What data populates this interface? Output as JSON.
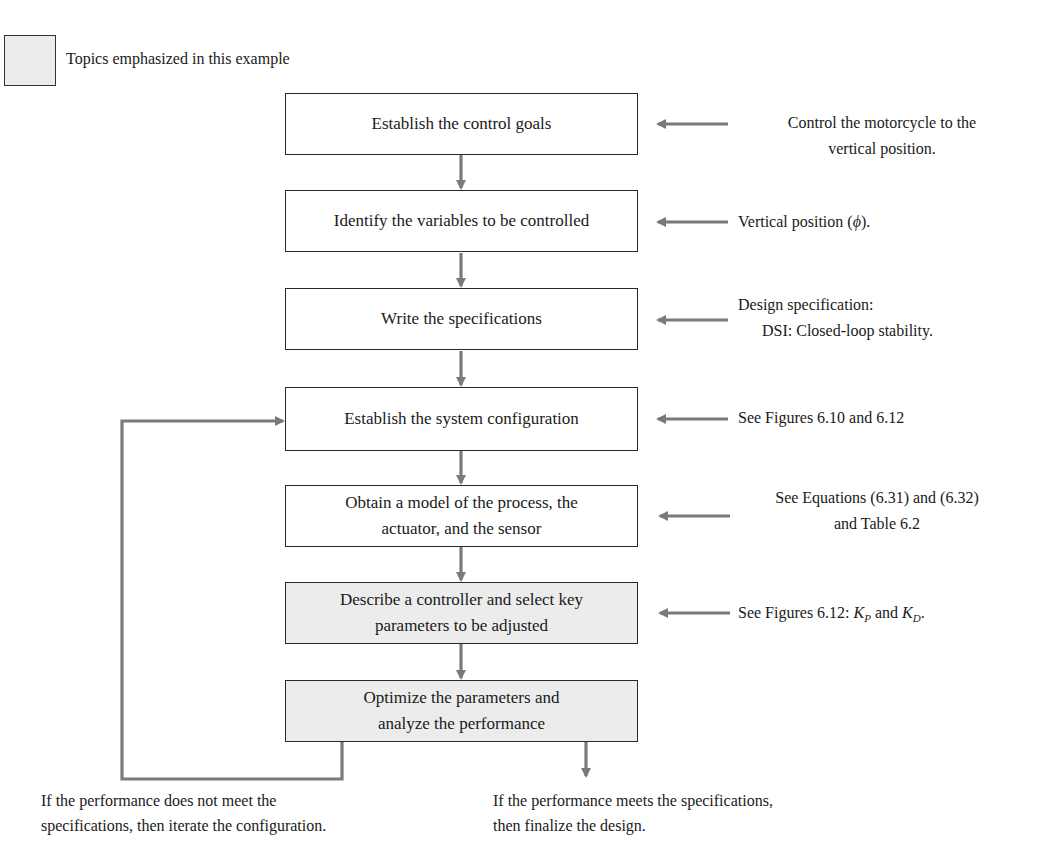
{
  "legend": {
    "label": "Topics emphasized in this example",
    "swatch_color": "#ececec"
  },
  "steps": [
    {
      "label": "Establish the control goals",
      "emphasized": false
    },
    {
      "label": "Identify the variables to be controlled",
      "emphasized": false
    },
    {
      "label": "Write the specifications",
      "emphasized": false
    },
    {
      "label": "Establish the system configuration",
      "emphasized": false
    },
    {
      "label_line1": "Obtain a model of the process, the",
      "label_line2": "actuator, and the sensor",
      "emphasized": false
    },
    {
      "label_line1": "Describe a controller and select key",
      "label_line2": "parameters to be adjusted",
      "emphasized": true
    },
    {
      "label_line1": "Optimize the parameters and",
      "label_line2": "analyze the performance",
      "emphasized": true
    }
  ],
  "annotations": [
    {
      "line1": "Control the motorcycle to the",
      "line2": "vertical position."
    },
    {
      "prefix": "Vertical position (",
      "symbol": "ϕ",
      "suffix": ")."
    },
    {
      "line1": "Design specification:",
      "line2": "DSI: Closed-loop stability."
    },
    {
      "line1": "See Figures 6.10 and 6.12"
    },
    {
      "line1": "See Equations (6.31) and (6.32)",
      "line2": "and Table 6.2"
    },
    {
      "prefix": "See Figures 6.12: ",
      "k1": "K",
      "k1_sub": "P",
      "mid": " and ",
      "k2": "K",
      "k2_sub": "D",
      "suffix": "."
    }
  ],
  "outcomes": {
    "fail": {
      "line1": "If the performance does not meet the",
      "line2": "specifications, then iterate the configuration."
    },
    "pass": {
      "line1": "If the performance meets the specifications,",
      "line2": "then finalize the design."
    }
  },
  "colors": {
    "arrow": "#7a7a7a",
    "box_border": "#2a2a2a",
    "emphasis_fill": "#ececec"
  }
}
